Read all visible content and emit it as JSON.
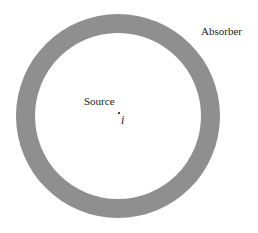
{
  "diagram": {
    "labels": {
      "absorber": "Absorber",
      "source": "Source",
      "point": "i"
    },
    "ring": {
      "center": [
        118,
        116
      ],
      "outer_radius": 102,
      "inner_radius": 83,
      "color": "#8f8f8f"
    }
  }
}
